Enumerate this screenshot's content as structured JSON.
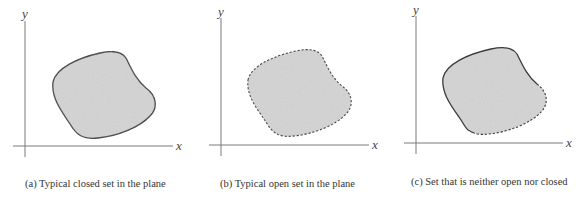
{
  "figure": {
    "panels": [
      {
        "id": "a",
        "caption": "(a) Typical closed set in the plane",
        "x_axis_label": "x",
        "y_axis_label": "y",
        "boundary_style": "solid"
      },
      {
        "id": "b",
        "caption": "(b) Typical open set in the plane",
        "x_axis_label": "x",
        "y_axis_label": "y",
        "boundary_style": "dashed"
      },
      {
        "id": "c",
        "caption": "(c) Set that is neither open nor closed",
        "x_axis_label": "x",
        "y_axis_label": "y",
        "boundary_style": "partly solid, partly dashed"
      }
    ],
    "colors": {
      "fill": "#d4d4d4",
      "boundary": "#3a3a3a",
      "axis": "#7a7a7a",
      "text": "#333333"
    }
  }
}
